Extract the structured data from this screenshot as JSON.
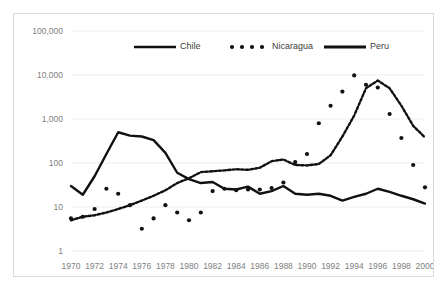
{
  "chart_data": {
    "type": "line",
    "title": "",
    "subtitle": "",
    "xlabel": "",
    "ylabel": "",
    "yscale": "log",
    "ylim": [
      1,
      100000
    ],
    "xlim": [
      1970,
      2000
    ],
    "grid": true,
    "legend_position": "top-center",
    "ytick_labels": [
      "100,000",
      "10,000",
      "1,000",
      "100",
      "10",
      "1"
    ],
    "ytick_values": [
      100000,
      10000,
      1000,
      100,
      10,
      1
    ],
    "xtick_labels": [
      "1970",
      "1972",
      "1974",
      "1976",
      "1978",
      "1980",
      "1982",
      "1984",
      "1986",
      "1988",
      "1990",
      "1992",
      "1994",
      "1996",
      "1998",
      "2000"
    ],
    "xtick_values": [
      1970,
      1972,
      1974,
      1976,
      1978,
      1980,
      1982,
      1984,
      1986,
      1988,
      1990,
      1992,
      1994,
      1996,
      1998,
      2000
    ],
    "x": [
      1970,
      1971,
      1972,
      1973,
      1974,
      1975,
      1976,
      1977,
      1978,
      1979,
      1980,
      1981,
      1982,
      1983,
      1984,
      1985,
      1986,
      1987,
      1988,
      1989,
      1990,
      1991,
      1992,
      1993,
      1994,
      1995,
      1996,
      1997,
      1998,
      1999,
      2000
    ],
    "series": [
      {
        "name": "Chile",
        "style": "dashed",
        "color": "#111111",
        "values": [
          5,
          6,
          6.5,
          7.5,
          9,
          11,
          14,
          18,
          24,
          35,
          45,
          62,
          65,
          68,
          72,
          70,
          78,
          110,
          120,
          90,
          88,
          95,
          150,
          400,
          1200,
          5000,
          7500,
          5000,
          2000,
          700,
          380
        ]
      },
      {
        "name": "Nicaragua",
        "style": "dotted",
        "color": "#111111",
        "values": [
          5.5,
          6,
          9,
          26,
          20,
          11,
          3.2,
          5.5,
          11,
          7.5,
          5,
          7.5,
          23,
          26,
          24,
          25,
          25,
          27,
          36,
          105,
          160,
          800,
          2000,
          4200,
          9800,
          6000,
          5200,
          1300,
          370,
          90,
          28
        ]
      },
      {
        "name": "Peru",
        "style": "solid",
        "color": "#111111",
        "values": [
          30,
          19,
          50,
          160,
          500,
          420,
          400,
          330,
          170,
          60,
          43,
          35,
          37,
          26,
          25,
          29,
          20,
          23,
          30,
          20,
          19,
          20,
          18,
          14,
          17,
          20,
          26,
          22,
          18,
          15,
          12
        ]
      }
    ],
    "legend": [
      {
        "label": "Chile",
        "style": "solid",
        "color": "#111111"
      },
      {
        "label": "Nicaragua",
        "style": "dotted",
        "color": "#111111"
      },
      {
        "label": "Peru",
        "style": "solid-thick",
        "color": "#111111"
      }
    ]
  }
}
